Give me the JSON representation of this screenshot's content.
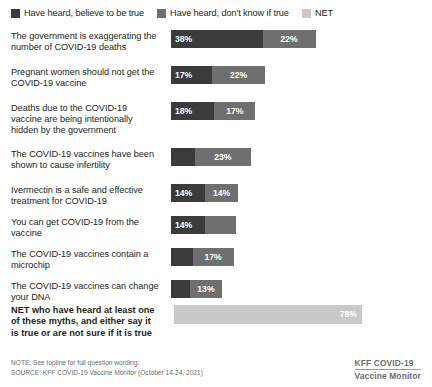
{
  "legend": {
    "items": [
      {
        "label": "Have heard, believe to be true",
        "color": "#3b3b3b",
        "icon": "square-swatch-dark"
      },
      {
        "label": "Have heard, don't know if true",
        "color": "#6f6f6f",
        "icon": "square-swatch-mid"
      },
      {
        "label": "NET",
        "color": "#c9c9c9",
        "icon": "square-swatch-light"
      }
    ]
  },
  "net_row": {
    "label": "NET who have heard at least one of these myths, and either say it is true or are not sure if it is true",
    "value_label": "78%",
    "value": 78
  },
  "footer": {
    "note": "NOTE: See topline for full question wording.",
    "source": "SOURCE: KFF COVID-19 Vaccine Monitor (October 14-24, 2021)",
    "brand_line1": "KFF COVID-19",
    "brand_line2": "Vaccine Monitor"
  },
  "chart_data": {
    "type": "bar",
    "title": "",
    "subtitle": "",
    "xlabel": "",
    "ylabel": "",
    "orientation": "horizontal",
    "stacked": true,
    "grid": false,
    "legend_position": "top-left",
    "xlim": [
      0,
      80
    ],
    "categories": [
      "The government is exaggerating the number of COVID-19 deaths",
      "Pregnant women should not get the COVID-19 vaccine",
      "Deaths due to the COVID-19 vaccine are being intentionally hidden by the government",
      "The COVID-19 vaccines have been shown to cause infertility",
      "Ivermectin is a safe and effective treatment for COVID-19",
      "You can get COVID-19 from the vaccine",
      "The COVID-19 vaccines contain a microchip",
      "The COVID-19 vaccines can change your DNA"
    ],
    "series": [
      {
        "name": "Have heard, believe to be true",
        "color": "#3b3b3b",
        "values": [
          38,
          17,
          18,
          10,
          14,
          14,
          9,
          8
        ],
        "labels": [
          "38%",
          "17%",
          "18%",
          "",
          "14%",
          "14%",
          "",
          ""
        ]
      },
      {
        "name": "Have heard, don't know if true",
        "color": "#6f6f6f",
        "values": [
          22,
          22,
          17,
          23,
          14,
          13,
          17,
          13
        ],
        "labels": [
          "22%",
          "22%",
          "17%",
          "23%",
          "14%",
          "",
          "17%",
          "13%"
        ]
      }
    ],
    "net": {
      "name": "NET",
      "color": "#c9c9c9",
      "category": "NET who have heard at least one of these myths, and either say it is true or are not sure if it is true",
      "value": 78,
      "label": "78%"
    }
  }
}
